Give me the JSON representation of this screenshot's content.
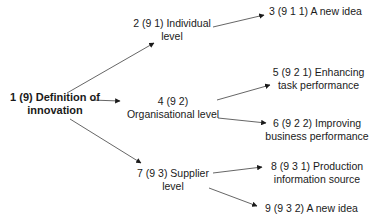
{
  "diagram": {
    "type": "tree",
    "edge_color": "#333333",
    "nodes": {
      "n1": {
        "line1": "1 (9) Definition of",
        "line2": "innovation"
      },
      "n2": {
        "line1": "2 (9 1) Individual",
        "line2": "level"
      },
      "n3": {
        "line1": "3 (9 1 1) A new idea"
      },
      "n4": {
        "line1": "4 (9 2)",
        "line2": "Organisational level"
      },
      "n5": {
        "line1": "5 (9 2 1) Enhancing",
        "line2": "task performance"
      },
      "n6": {
        "line1": "6 (9 2 2) Improving",
        "line2": "business performance"
      },
      "n7": {
        "line1": "7 (9 3) Supplier",
        "line2": "level"
      },
      "n8": {
        "line1": "8 (9 3 1) Production",
        "line2": "information source"
      },
      "n9": {
        "line1": "9 (9 3 2) A new idea"
      }
    },
    "edges": [
      {
        "from": "n1",
        "to": "n2"
      },
      {
        "from": "n1",
        "to": "n4"
      },
      {
        "from": "n1",
        "to": "n7"
      },
      {
        "from": "n2",
        "to": "n3"
      },
      {
        "from": "n4",
        "to": "n5"
      },
      {
        "from": "n4",
        "to": "n6"
      },
      {
        "from": "n7",
        "to": "n8"
      },
      {
        "from": "n7",
        "to": "n9"
      }
    ]
  }
}
